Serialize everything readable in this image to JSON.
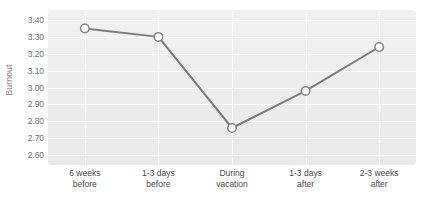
{
  "chart_data": {
    "type": "line",
    "title": "",
    "xlabel": "",
    "ylabel": "Burnout",
    "ylim": [
      2.6,
      3.4
    ],
    "ytick_step": 0.1,
    "grid": true,
    "legend": "none",
    "categories": [
      "6 weeks before",
      "1-3 days before",
      "During vacation",
      "1-3 days after",
      "2-3 weeks after"
    ],
    "category_lines": [
      [
        "6 weeks",
        "before"
      ],
      [
        "1-3 days",
        "before"
      ],
      [
        "During",
        "vacation"
      ],
      [
        "1-3 days",
        "after"
      ],
      [
        "2-3 weeks",
        "after"
      ]
    ],
    "values": [
      3.35,
      3.3,
      2.76,
      2.98,
      3.24
    ],
    "ytick_labels": [
      "3.40",
      "3.30",
      "3.20",
      "3.10",
      "3.00",
      "2.90",
      "2.80",
      "2.70",
      "2.60"
    ],
    "ytick_values": [
      3.4,
      3.3,
      3.2,
      3.1,
      3.0,
      2.9,
      2.8,
      2.7,
      2.6
    ],
    "series": [
      {
        "name": "Burnout",
        "values": [
          3.35,
          3.3,
          2.76,
          2.98,
          3.24
        ]
      }
    ]
  },
  "style": {
    "line_color": "#7c7c7c",
    "marker_fill": "#ffffff",
    "marker_stroke": "#8a8a8a",
    "plot_background": "#efefef",
    "gridline_color": "#fbfbfb",
    "tick_text_color": "#4a4a4a",
    "axis_title_color": "#7b7b7b",
    "page_background": "#ffffff"
  }
}
